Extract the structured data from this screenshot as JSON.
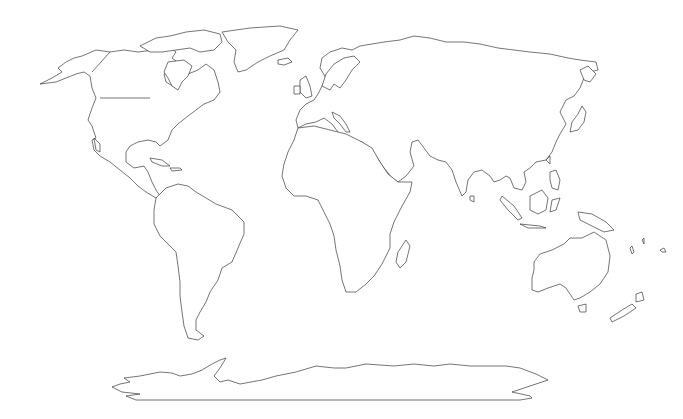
{
  "map": {
    "type": "world-outline",
    "projection": "equirectangular-like",
    "labels": [],
    "colors": {
      "land_fill": "#ffffff",
      "outline": "#3a3a3a",
      "background": "#ffffff"
    },
    "regions": [
      "north-america",
      "greenland",
      "canadian-arctic-islands",
      "south-america",
      "europe",
      "africa",
      "madagascar",
      "asia",
      "japan",
      "southeast-asia-islands",
      "australia",
      "new-zealand",
      "antarctica",
      "iceland",
      "british-isles"
    ]
  }
}
